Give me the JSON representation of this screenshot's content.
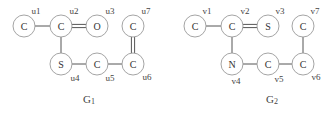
{
  "graphs": [
    {
      "id": "G1",
      "title": "G",
      "title_sub": "1",
      "nodes": [
        {
          "id": "u1",
          "atom": "C",
          "label": "u1"
        },
        {
          "id": "u2",
          "atom": "C",
          "label": "u2"
        },
        {
          "id": "u3",
          "atom": "O",
          "label": "u3"
        },
        {
          "id": "u4",
          "atom": "S",
          "label": "u4"
        },
        {
          "id": "u5",
          "atom": "C",
          "label": "u5"
        },
        {
          "id": "u6",
          "atom": "C",
          "label": "u6"
        },
        {
          "id": "u7",
          "atom": "C",
          "label": "u7"
        }
      ],
      "edges": [
        {
          "from": "u1",
          "to": "u2",
          "order": 1
        },
        {
          "from": "u2",
          "to": "u3",
          "order": 2
        },
        {
          "from": "u2",
          "to": "u4",
          "order": 1
        },
        {
          "from": "u4",
          "to": "u5",
          "order": 1
        },
        {
          "from": "u5",
          "to": "u6",
          "order": 1
        },
        {
          "from": "u6",
          "to": "u7",
          "order": 2
        }
      ]
    },
    {
      "id": "G2",
      "title": "G",
      "title_sub": "2",
      "nodes": [
        {
          "id": "v1",
          "atom": "C",
          "label": "v1"
        },
        {
          "id": "v2",
          "atom": "C",
          "label": "v2"
        },
        {
          "id": "v3",
          "atom": "S",
          "label": "v3"
        },
        {
          "id": "v4",
          "atom": "N",
          "label": "v4"
        },
        {
          "id": "v5",
          "atom": "C",
          "label": "v5"
        },
        {
          "id": "v6",
          "atom": "C",
          "label": "v6"
        },
        {
          "id": "v7",
          "atom": "C",
          "label": "v7"
        }
      ],
      "edges": [
        {
          "from": "v1",
          "to": "v2",
          "order": 1
        },
        {
          "from": "v2",
          "to": "v3",
          "order": 2
        },
        {
          "from": "v2",
          "to": "v4",
          "order": 1
        },
        {
          "from": "v4",
          "to": "v5",
          "order": 1
        },
        {
          "from": "v5",
          "to": "v6",
          "order": 1
        },
        {
          "from": "v6",
          "to": "v7",
          "order": 1
        }
      ]
    }
  ]
}
